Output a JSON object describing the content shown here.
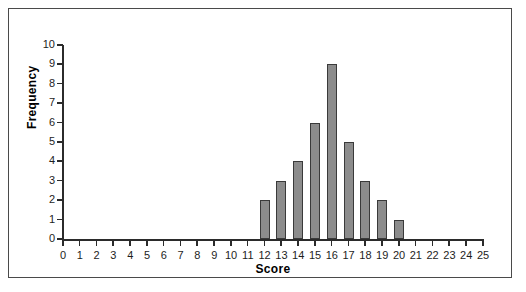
{
  "chart_data": {
    "type": "bar",
    "title": "",
    "xlabel": "Score",
    "ylabel": "Frequency",
    "xlim": [
      0,
      25
    ],
    "ylim": [
      0,
      10
    ],
    "grid": false,
    "legend": null,
    "x_ticks": [
      0,
      1,
      2,
      3,
      4,
      5,
      6,
      7,
      8,
      9,
      10,
      11,
      12,
      13,
      14,
      15,
      16,
      17,
      18,
      19,
      20,
      21,
      22,
      23,
      24,
      25
    ],
    "y_ticks": [
      0,
      1,
      2,
      3,
      4,
      5,
      6,
      7,
      8,
      9,
      10
    ],
    "categories": [
      12,
      13,
      14,
      15,
      16,
      17,
      18,
      19,
      20
    ],
    "values": [
      2,
      3,
      4,
      6,
      9,
      5,
      3,
      2,
      1
    ],
    "bar_fill_color": "#8c8c8c",
    "bar_border_color": "#3a3a3a",
    "axis_color": "#2b2b2b",
    "background_color": "#ffffff",
    "frame_color": "#4a4a4a"
  }
}
